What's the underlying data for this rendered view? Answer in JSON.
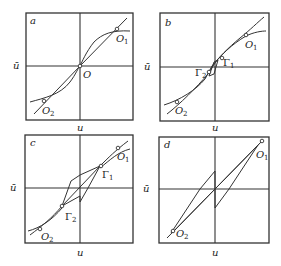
{
  "figure": {
    "panels": [
      {
        "id": "a",
        "label": "a",
        "x_axis_label": "u",
        "y_axis_label": "ū",
        "points": [
          {
            "name": "O",
            "sub": "1",
            "text": "O"
          },
          {
            "name": "O1",
            "text": "O",
            "sub": "1"
          },
          {
            "name": "O2",
            "text": "O",
            "sub": "2"
          }
        ]
      },
      {
        "id": "b",
        "label": "b",
        "x_axis_label": "u",
        "y_axis_label": "ū",
        "points": [
          {
            "name": "O1",
            "text": "O",
            "sub": "1"
          },
          {
            "name": "O2",
            "text": "O",
            "sub": "2"
          },
          {
            "name": "Γ1",
            "text": "Γ",
            "sub": "1"
          },
          {
            "name": "Γ2",
            "text": "Γ",
            "sub": "2"
          }
        ]
      },
      {
        "id": "c",
        "label": "c",
        "x_axis_label": "u",
        "y_axis_label": "ū",
        "points": [
          {
            "name": "O1",
            "text": "O",
            "sub": "1"
          },
          {
            "name": "O2",
            "text": "O",
            "sub": "2"
          },
          {
            "name": "Γ1",
            "text": "Γ",
            "sub": "1"
          },
          {
            "name": "Γ2",
            "text": "Γ",
            "sub": "2"
          }
        ]
      },
      {
        "id": "d",
        "label": "d",
        "x_axis_label": "u",
        "y_axis_label": "ū",
        "points": [
          {
            "name": "O1",
            "text": "O",
            "sub": "1"
          },
          {
            "name": "O2",
            "text": "O",
            "sub": "2"
          }
        ]
      }
    ],
    "labels": {
      "a": "a",
      "b": "b",
      "c": "c",
      "d": "d",
      "u": "u",
      "ubar": "ū",
      "O": "O",
      "sub1": "1",
      "sub2": "2",
      "Gamma": "Γ"
    },
    "colors": {
      "ink": "#333333",
      "background": "#ffffff"
    }
  }
}
